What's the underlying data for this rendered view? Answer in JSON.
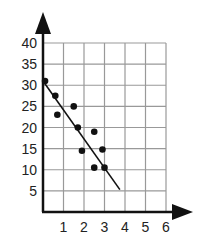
{
  "chart_data": {
    "type": "scatter",
    "title": "",
    "xlabel": "",
    "ylabel": "",
    "xlim": [
      0,
      6
    ],
    "ylim": [
      0,
      40
    ],
    "grid": true,
    "x_ticks": [
      "1",
      "2",
      "3",
      "4",
      "5",
      "6"
    ],
    "y_ticks": [
      "5",
      "10",
      "15",
      "20",
      "25",
      "30",
      "35",
      "40"
    ],
    "series": [
      {
        "name": "points",
        "x": [
          0.1,
          0.6,
          0.7,
          1.5,
          1.7,
          1.9,
          2.5,
          2.5,
          2.9,
          3.0
        ],
        "y": [
          31,
          27.5,
          23,
          25,
          20,
          14.5,
          19,
          10.5,
          14.8,
          10.5
        ]
      }
    ],
    "trend_line": {
      "x": [
        0,
        3.75
      ],
      "y": [
        31,
        5.3
      ]
    },
    "legend": null
  },
  "style": {
    "axis_color": "#111111",
    "grid_color": "#999999",
    "point_color": "#111111",
    "line_color": "#111111"
  }
}
